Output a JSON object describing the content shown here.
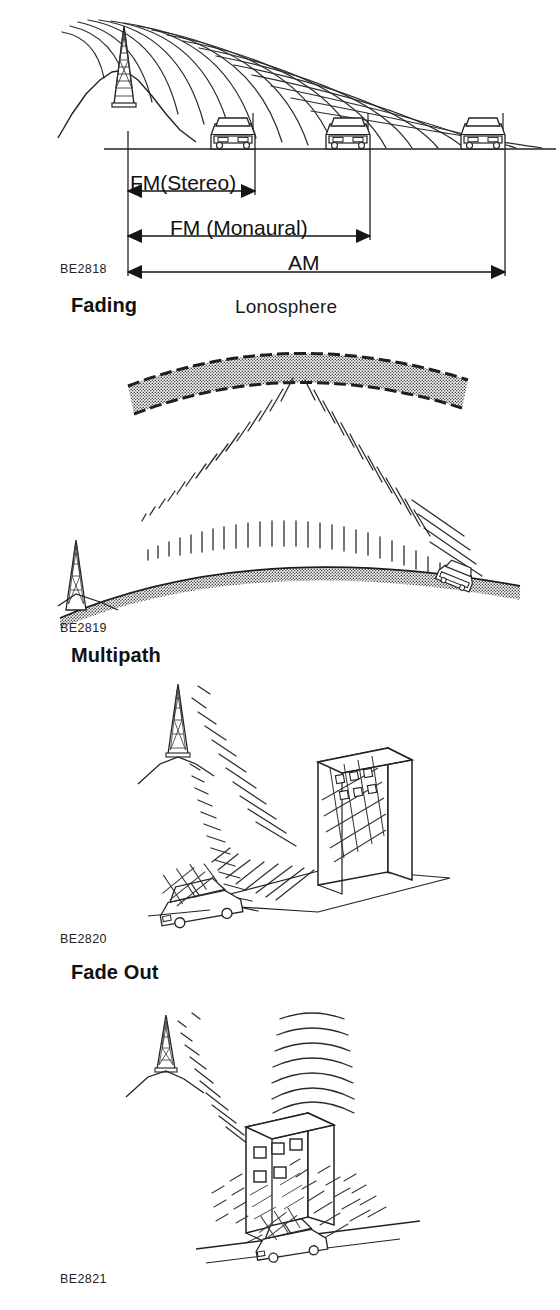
{
  "document": {
    "type": "technical-illustration-page",
    "background_color": "#ffffff",
    "ink_color": "#1a1a1a"
  },
  "figures": [
    {
      "id": "reception-range",
      "caption": "BE2818",
      "heading_below": "Fading",
      "elements": {
        "transmitter": "broadcast-tower-on-hill",
        "vehicles": 3,
        "ground_line": true
      },
      "range_bars": [
        {
          "label": "FM(Stereo)",
          "rank": 1,
          "relative_length": 0.34
        },
        {
          "label": "FM (Monaural)",
          "rank": 2,
          "relative_length": 0.64
        },
        {
          "label": "AM",
          "rank": 3,
          "relative_length": 1.0
        }
      ]
    },
    {
      "id": "fading",
      "caption": "BE2819",
      "heading_below": "Multipath",
      "layer_label": "Lonosphere",
      "elements": {
        "ionosphere_band": "stippled-curved-band",
        "earth_curve": "stippled-arc",
        "transmitter": "broadcast-tower",
        "vehicle": 1,
        "skywave_paths": 2,
        "groundwave": true
      }
    },
    {
      "id": "multipath",
      "caption": "BE2820",
      "heading_below": "Fade Out",
      "elements": {
        "transmitter": "broadcast-tower-on-hill",
        "building": "slab-building-3d",
        "vehicle": 1,
        "direct_wave": true,
        "reflected_wave": true
      }
    },
    {
      "id": "fade-out",
      "caption": "BE2821",
      "heading_below": null,
      "elements": {
        "transmitter": "broadcast-tower-on-hill",
        "building": "block-building-with-windows",
        "vehicle": 1,
        "blocked_wave": true,
        "shadow_zone": true,
        "overhead_wave": true
      }
    }
  ],
  "headings": {
    "fading": "Fading",
    "multipath": "Multipath",
    "fade_out": "Fade Out"
  },
  "captions": {
    "be2818": "BE2818",
    "be2819": "BE2819",
    "be2820": "BE2820",
    "be2821": "BE2821"
  },
  "labels": {
    "ionosphere": "Lonosphere",
    "fm_stereo": "FM(Stereo)",
    "fm_monaural": "FM (Monaural)",
    "am": "AM"
  }
}
